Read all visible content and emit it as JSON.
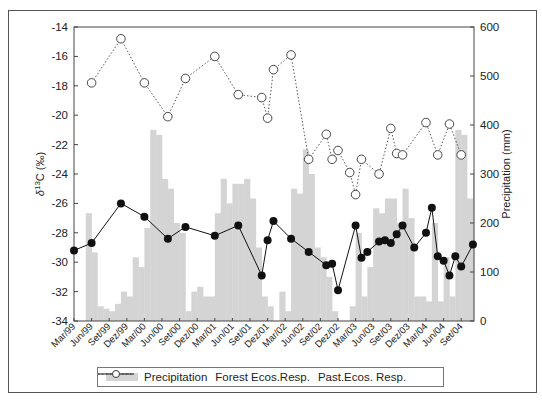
{
  "chart_data": {
    "type": "bar+line",
    "title": "",
    "xlabel": "",
    "ylabel_left": "δ13C (‰)",
    "ylabel_right": "Precipitation (mm)",
    "ylim_left": [
      -34,
      -14
    ],
    "ylim_right": [
      0,
      600
    ],
    "yticks_left": [
      -14,
      -16,
      -18,
      -20,
      -22,
      -24,
      -26,
      -28,
      -30,
      -32,
      -34
    ],
    "yticks_right": [
      600,
      500,
      400,
      300,
      200,
      100,
      0
    ],
    "x_tick_labels": [
      "Mar/99",
      "Jun/99",
      "Set/99",
      "Dez/99",
      "Mar/00",
      "Jun/00",
      "Set/00",
      "Dez/00",
      "Mar/01",
      "Jun/01",
      "Set/01",
      "Dez/01",
      "Mar/02",
      "Jun/02",
      "Set/02",
      "Dez/02",
      "Mar/03",
      "Jun/03",
      "Set/03",
      "Dez/03",
      "Mar/04",
      "Jun/04",
      "Set/04"
    ],
    "grid": false,
    "legend_position": "bottom",
    "legend": [
      "Precipitation",
      "Forest Ecos.Resp.",
      "Past.Ecos. Resp."
    ],
    "precipitation_monthly": {
      "start": "Mar/99",
      "unit": "mm",
      "values": [
        0,
        0,
        220,
        140,
        30,
        25,
        20,
        35,
        60,
        50,
        130,
        110,
        190,
        390,
        380,
        290,
        270,
        200,
        180,
        20,
        60,
        70,
        50,
        50,
        220,
        290,
        240,
        280,
        280,
        290,
        250,
        150,
        50,
        30,
        0,
        60,
        20,
        270,
        260,
        350,
        300,
        150,
        130,
        90,
        20,
        0,
        0,
        30,
        180,
        50,
        110,
        230,
        220,
        250,
        250,
        200,
        270,
        210,
        50,
        50,
        40,
        200,
        40,
        130,
        50,
        390,
        380,
        250,
        300,
        330,
        230,
        170,
        50,
        150,
        110,
        130,
        120
      ]
    },
    "series": [
      {
        "name": "Forest Ecos.Resp.",
        "axis": "left",
        "style": "solid line, filled circles",
        "points": [
          {
            "x": "Mar/99",
            "y": -29.2
          },
          {
            "x": "Jun/99",
            "y": -28.7
          },
          {
            "x": "Nov/99",
            "y": -26.0
          },
          {
            "x": "Mar/00",
            "y": -26.9
          },
          {
            "x": "Jul/00",
            "y": -28.4
          },
          {
            "x": "Oct/00",
            "y": -27.6
          },
          {
            "x": "Mar/01",
            "y": -28.2
          },
          {
            "x": "Jul/01",
            "y": -27.5
          },
          {
            "x": "Nov/01",
            "y": -30.9
          },
          {
            "x": "Dez/01",
            "y": -28.5
          },
          {
            "x": "Jan/02",
            "y": -27.2
          },
          {
            "x": "Apr/02",
            "y": -28.4
          },
          {
            "x": "Jul/02",
            "y": -29.3
          },
          {
            "x": "Oct/02",
            "y": -30.2
          },
          {
            "x": "Nov/02",
            "y": -30.1
          },
          {
            "x": "Dez/02",
            "y": -31.9
          },
          {
            "x": "Mar/03",
            "y": -27.5
          },
          {
            "x": "Apr/03",
            "y": -29.7
          },
          {
            "x": "May/03",
            "y": -29.3
          },
          {
            "x": "Jul/03",
            "y": -28.6
          },
          {
            "x": "Aug/03",
            "y": -28.5
          },
          {
            "x": "Set/03",
            "y": -28.7
          },
          {
            "x": "Oct/03",
            "y": -28.1
          },
          {
            "x": "Nov/03",
            "y": -27.5
          },
          {
            "x": "Jan/04",
            "y": -29.0
          },
          {
            "x": "Mar/04",
            "y": -28.0
          },
          {
            "x": "Apr/04",
            "y": -26.3
          },
          {
            "x": "May/04",
            "y": -29.6
          },
          {
            "x": "Jun/04",
            "y": -29.9
          },
          {
            "x": "Jul/04",
            "y": -30.9
          },
          {
            "x": "Aug/04",
            "y": -29.6
          },
          {
            "x": "Set/04",
            "y": -30.3
          },
          {
            "x": "Nov/04",
            "y": -28.8
          }
        ]
      },
      {
        "name": "Past.Ecos. Resp.",
        "axis": "left",
        "style": "dotted line, open circles",
        "points": [
          {
            "x": "Jun/99",
            "y": -17.8
          },
          {
            "x": "Nov/99",
            "y": -14.8
          },
          {
            "x": "Mar/00",
            "y": -17.8
          },
          {
            "x": "Jul/00",
            "y": -20.1
          },
          {
            "x": "Oct/00",
            "y": -17.5
          },
          {
            "x": "Mar/01",
            "y": -16.0
          },
          {
            "x": "Jul/01",
            "y": -18.6
          },
          {
            "x": "Nov/01",
            "y": -18.8
          },
          {
            "x": "Dez/01",
            "y": -20.2
          },
          {
            "x": "Jan/02",
            "y": -16.9
          },
          {
            "x": "Apr/02",
            "y": -15.9
          },
          {
            "x": "Jul/02",
            "y": -23.0
          },
          {
            "x": "Oct/02",
            "y": -21.3
          },
          {
            "x": "Nov/02",
            "y": -23.0
          },
          {
            "x": "Dez/02",
            "y": -22.4
          },
          {
            "x": "Feb/03",
            "y": -23.9
          },
          {
            "x": "Mar/03",
            "y": -25.4
          },
          {
            "x": "Apr/03",
            "y": -23.0
          },
          {
            "x": "Jul/03",
            "y": -24.0
          },
          {
            "x": "Set/03",
            "y": -20.9
          },
          {
            "x": "Oct/03",
            "y": -22.6
          },
          {
            "x": "Nov/03",
            "y": -22.7
          },
          {
            "x": "Mar/04",
            "y": -20.5
          },
          {
            "x": "May/04",
            "y": -22.7
          },
          {
            "x": "Jul/04",
            "y": -20.6
          },
          {
            "x": "Set/04",
            "y": -22.7
          }
        ]
      }
    ],
    "colors": {
      "precipitation": "#d4d4d4",
      "forest": "#111111",
      "pasture": "#444444"
    }
  },
  "legend": {
    "precip_label": "Precipitation",
    "forest_label": "Forest Ecos.Resp.",
    "past_label": "Past.Ecos. Resp."
  }
}
